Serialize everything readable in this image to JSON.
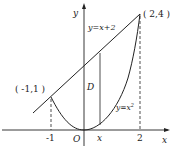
{
  "diagram": {
    "axes": {
      "x_label": "x",
      "y_label": "y",
      "origin_label": "O"
    },
    "ticks": {
      "neg_one": "-1",
      "x_var": "x",
      "two": "2"
    },
    "points": {
      "left": "( -1,1 )",
      "right": "( 2,4 )"
    },
    "curves": {
      "line_label": "y=x+2",
      "parabola_label": "y=x",
      "parabola_exp": "2"
    },
    "region_label": "D",
    "colors": {
      "stroke": "#222222",
      "background": "#ffffff"
    }
  }
}
